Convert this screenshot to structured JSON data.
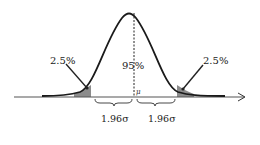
{
  "diagram": {
    "type": "normal-distribution",
    "labels": {
      "left_tail": "2.5%",
      "right_tail": "2.5%",
      "center": "95%",
      "mean": "μ",
      "left_interval": "1.96σ",
      "right_interval": "1.96σ"
    },
    "colors": {
      "curve": "#1a1a1a",
      "tail_fill": "#8c8c8c",
      "axis": "#555555",
      "text": "#222222"
    }
  }
}
